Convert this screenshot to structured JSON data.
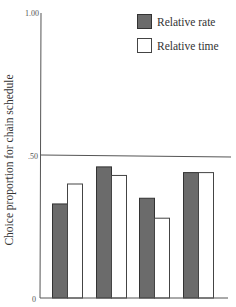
{
  "chart_data": {
    "type": "bar",
    "title": "",
    "xlabel": "",
    "ylabel": "Choice proportion for chain schedule",
    "ylim": [
      0,
      1.0
    ],
    "yticks": [
      {
        "value": 0,
        "label": "0"
      },
      {
        "value": 0.5,
        "label": ".50"
      },
      {
        "value": 1.0,
        "label": "1.00"
      }
    ],
    "reference_line": {
      "value": 0.5
    },
    "categories": [
      "1",
      "2",
      "3",
      "4"
    ],
    "category_labels_visible": false,
    "series": [
      {
        "name": "Relative rate",
        "color": "#6b6b6b",
        "values": [
          0.33,
          0.46,
          0.35,
          0.44
        ]
      },
      {
        "name": "Relative time",
        "color": "#ffffff",
        "values": [
          0.4,
          0.43,
          0.28,
          0.44
        ]
      }
    ],
    "grid": false,
    "legend_position": "top-right"
  },
  "legend": {
    "items": [
      {
        "label": "Relative rate",
        "swatch": "#6b6b6b"
      },
      {
        "label": "Relative time",
        "swatch": "#ffffff"
      }
    ]
  },
  "axis": {
    "ylabel": "Choice proportion for chain schedule",
    "tick_top": "1.00",
    "tick_mid": ".50",
    "tick_zero": "0"
  }
}
